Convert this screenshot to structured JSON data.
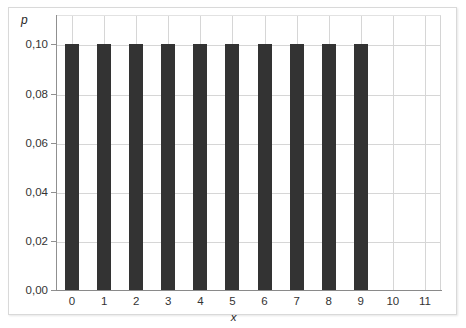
{
  "chart_data": {
    "type": "bar",
    "title": "",
    "subtitle": "",
    "xlabel": "x",
    "ylabel": "p",
    "categories": [
      "0",
      "1",
      "2",
      "3",
      "4",
      "5",
      "6",
      "7",
      "8",
      "9",
      "10",
      "11"
    ],
    "values": [
      0.1,
      0.1,
      0.1,
      0.1,
      0.1,
      0.1,
      0.1,
      0.1,
      0.1,
      0.1,
      0,
      0
    ],
    "x_tick_labels": [
      "0",
      "1",
      "2",
      "3",
      "4",
      "5",
      "6",
      "7",
      "8",
      "9",
      "10",
      "11"
    ],
    "y_tick_labels": [
      "0,00",
      "0,02",
      "0,04",
      "0,06",
      "0,08",
      "0,10"
    ],
    "y_tick_values": [
      0.0,
      0.02,
      0.04,
      0.06,
      0.08,
      0.1
    ],
    "xlim": [
      -0.5,
      11.5
    ],
    "ylim": [
      0,
      0.112
    ],
    "grid": "both",
    "legend": "none",
    "annotations": [],
    "decimal_separator": ",",
    "bar_color": "#333333",
    "grid_color": "#d6d6d6",
    "axis_color": "#8a8a8a",
    "background_color": "#ffffff",
    "frame_border_color": "#d9d9d9"
  }
}
